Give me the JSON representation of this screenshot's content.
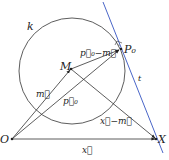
{
  "labels": {
    "circle": "k",
    "center": "M",
    "tangent_point": "P₀",
    "origin": "O",
    "point_x": "X",
    "tangent": "t",
    "vec_m": "m⃗",
    "vec_p0": "p⃗₀",
    "vec_p0_minus_m": "p⃗₀−m⃗",
    "vec_x": "x⃗",
    "vec_x_minus_m": "x⃗−m⃗"
  },
  "colors": {
    "stroke": "#333333",
    "tangent": "#4a66c8"
  }
}
